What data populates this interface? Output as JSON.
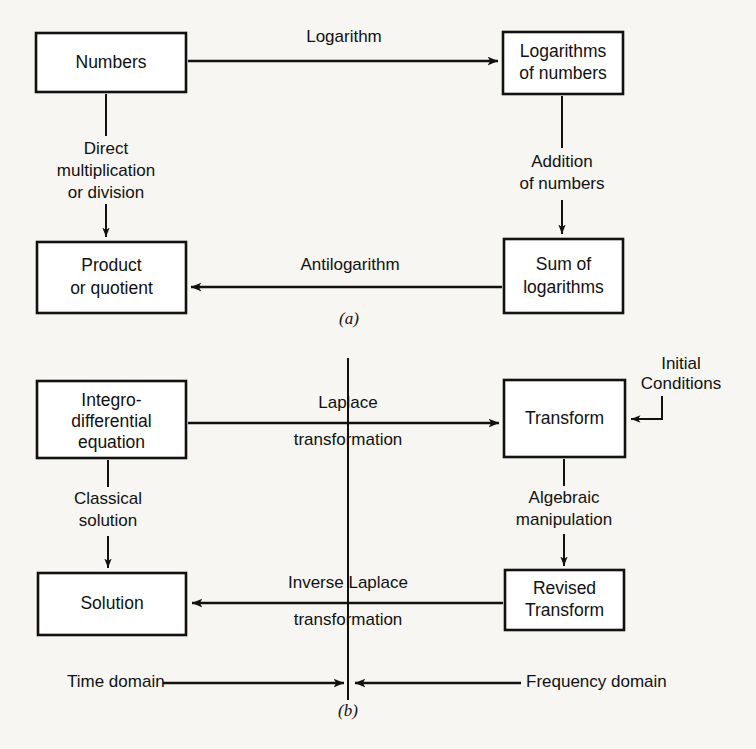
{
  "figure": {
    "title": "",
    "panels": [
      {
        "caption": "(a)",
        "nodes": [
          {
            "id": "numbers",
            "lines": [
              "Numbers"
            ]
          },
          {
            "id": "logs-of-numbers",
            "lines": [
              "Logarithms",
              "of numbers"
            ]
          },
          {
            "id": "product-or-quotient",
            "lines": [
              "Product",
              "or quotient"
            ]
          },
          {
            "id": "sum-of-logarithms",
            "lines": [
              "Sum of",
              "logarithms"
            ]
          }
        ],
        "edges": [
          {
            "id": "logarithm",
            "lines": [
              "Logarithm"
            ]
          },
          {
            "id": "direct-multiplication",
            "lines": [
              "Direct",
              "multiplication",
              "or division"
            ]
          },
          {
            "id": "addition-of-numbers",
            "lines": [
              "Addition",
              "of numbers"
            ]
          },
          {
            "id": "antilogarithm",
            "lines": [
              "Antilogarithm"
            ]
          }
        ]
      },
      {
        "caption": "(b)",
        "nodes": [
          {
            "id": "integro-differential-equation",
            "lines": [
              "Integro-",
              "differential",
              "equation"
            ]
          },
          {
            "id": "transform",
            "lines": [
              "Transform"
            ]
          },
          {
            "id": "solution",
            "lines": [
              "Solution"
            ]
          },
          {
            "id": "revised-transform",
            "lines": [
              "Revised",
              "Transform"
            ]
          }
        ],
        "edges": [
          {
            "id": "laplace-transformation",
            "lines": [
              "Laplace",
              "transformation"
            ]
          },
          {
            "id": "classical-solution",
            "lines": [
              "Classical",
              "solution"
            ]
          },
          {
            "id": "algebraic-manipulation",
            "lines": [
              "Algebraic",
              "manipulation"
            ]
          },
          {
            "id": "inverse-laplace-transformation",
            "lines": [
              "Inverse Laplace",
              "transformation"
            ]
          },
          {
            "id": "initial-conditions",
            "lines": [
              "Initial",
              "Conditions"
            ]
          }
        ],
        "domains": [
          {
            "id": "time-domain",
            "label": "Time domain"
          },
          {
            "id": "frequency-domain",
            "label": "Frequency domain"
          }
        ]
      }
    ]
  },
  "colors": {
    "ink": "#111111",
    "paper": "#f7f6f3",
    "box_fill": "#ffffff"
  }
}
